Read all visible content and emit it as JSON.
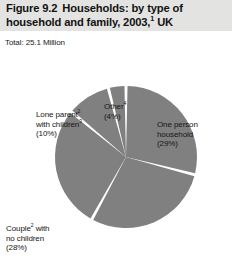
{
  "figure": {
    "title_line1_number": "Figure 9.2",
    "title_line1_text": "Households: by type of",
    "title_line2": "household and family, 2003,¹ UK",
    "total_label": "Total: 25.1 Million"
  },
  "chart_data": {
    "type": "pie",
    "subtitle": "Total: 25.1 Million",
    "total": "25.1 Million",
    "unit": "percentages",
    "legend_position": "callout-labels",
    "grid": false,
    "categories": [
      "One person household",
      "Couple² with children³",
      "Couple² with no children",
      "Lone parent² with children³",
      "Other⁴"
    ],
    "values": [
      29,
      29,
      28,
      10,
      4
    ],
    "slices": [
      {
        "id": "one-person-household",
        "line1": "One person",
        "line2": "household",
        "line3": "(29%)",
        "value": 29,
        "percent_label": "(29%)",
        "start_angle": 0,
        "end_angle": 104.4,
        "color": "#808080"
      },
      {
        "id": "couple-with-children",
        "line1": "Couple² with",
        "line2": "children³",
        "line3": "(29%)",
        "value": 29,
        "percent_label": "(29%)",
        "start_angle": 104.4,
        "end_angle": 208.8,
        "color": "#808080"
      },
      {
        "id": "couple-no-children",
        "line1": "Couple² with",
        "line2": "no children",
        "line3": "(28%)",
        "value": 28,
        "percent_label": "(28%)",
        "start_angle": 208.8,
        "end_angle": 309.6,
        "color": "#808080"
      },
      {
        "id": "lone-parent-with-children",
        "line1": "Lone parent²",
        "line2": "with children³",
        "line3": "(10%)",
        "value": 10,
        "percent_label": "(10%)",
        "start_angle": 309.6,
        "end_angle": 345.6,
        "color": "#808080"
      },
      {
        "id": "other",
        "line1": "Other⁴",
        "line2": "(4%)",
        "line3": "",
        "value": 4,
        "percent_label": "(4%)",
        "start_angle": 345.6,
        "end_angle": 360,
        "color": "#808080"
      }
    ],
    "colors": {
      "slice_fill": "#808080",
      "slice_gap": "#ffffff",
      "title_band": "#e3e3e1",
      "text": "#161616"
    }
  }
}
